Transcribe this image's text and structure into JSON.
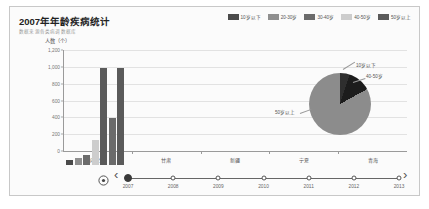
{
  "header": {
    "title": "2007年年龄疾病统计",
    "subtitle": "数据来源各类病调数据库"
  },
  "legend": {
    "items": [
      {
        "label": "10岁以下",
        "color": "#4a4a4a"
      },
      {
        "label": "20-30岁",
        "color": "#8f8f8f"
      },
      {
        "label": "30-40岁",
        "color": "#6b6b6b"
      },
      {
        "label": "40-50岁",
        "color": "#cdcdcd"
      },
      {
        "label": "50岁以上",
        "color": "#5a5a5a"
      }
    ]
  },
  "chart_data": {
    "type": "bar",
    "title": "2007年年龄疾病统计",
    "xlabel": "",
    "ylabel": "人数（个）",
    "ylim": [
      0,
      1200
    ],
    "yticks": [
      0,
      200,
      400,
      600,
      800,
      1000,
      1200
    ],
    "ytick_labels": [
      "0",
      "200",
      "400",
      "600",
      "800",
      "1,000",
      "1,200"
    ],
    "grid": true,
    "legend_position": "top-right",
    "categories": [
      "内蒙古",
      "甘肃",
      "新疆",
      "宁夏",
      "青海"
    ],
    "series": [
      {
        "name": "10岁以下",
        "color": "#4a4a4a",
        "values": [
          60,
          0,
          0,
          0,
          0
        ]
      },
      {
        "name": "20-30岁",
        "color": "#8f8f8f",
        "values": [
          80,
          0,
          0,
          0,
          0
        ]
      },
      {
        "name": "30-40岁",
        "color": "#6b6b6b",
        "values": [
          120,
          0,
          0,
          0,
          0
        ]
      },
      {
        "name": "40-50岁",
        "color": "#cdcdcd",
        "values": [
          300,
          0,
          0,
          0,
          0
        ]
      },
      {
        "name": "50岁以上",
        "color": "#5a5a5a",
        "values": [
          1150,
          0,
          0,
          0,
          0
        ]
      }
    ],
    "extra_bars": [
      {
        "name": "30-40岁",
        "color": "#6b6b6b",
        "value": 560
      }
    ]
  },
  "pie_data": {
    "type": "pie",
    "slices": [
      {
        "label": "10岁以下",
        "value": 5,
        "color": "#2e2e2e"
      },
      {
        "label": "40-50岁",
        "value": 12,
        "color": "#1c1c1c"
      },
      {
        "label": "50岁以上",
        "value": 83,
        "color": "#8c8c8c"
      }
    ],
    "callouts": {
      "top": "10岁以下",
      "right": "40-50岁",
      "left": "50岁以上"
    }
  },
  "timeline": {
    "play_icon": "play-circle-icon",
    "prev_icon": "chevron-left-icon",
    "next_icon": "chevron-right-icon",
    "prev_glyph": "‹",
    "next_glyph": "›",
    "selected": "2007",
    "years": [
      "2007",
      "2008",
      "2009",
      "2010",
      "2011",
      "2012",
      "2013"
    ]
  }
}
